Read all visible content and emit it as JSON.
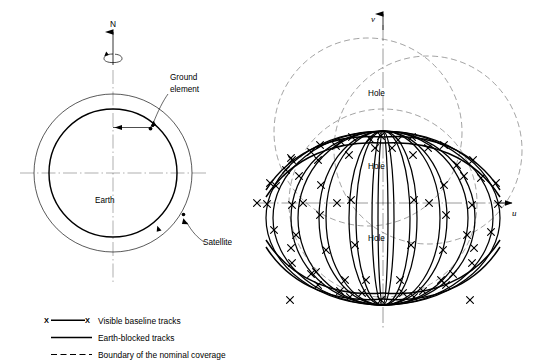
{
  "figure": {
    "background_color": "#ffffff",
    "ink_color": "#000000"
  },
  "left_diagram": {
    "name": "earth-orbit-geometry",
    "labels": {
      "north_axis": "N",
      "ground_element": "Ground\nelement",
      "ground_element_line1": "Ground",
      "ground_element_line2": "element",
      "earth": "Earth",
      "satellite": "Satellite"
    },
    "geometry": {
      "center_x": 113,
      "center_y": 173,
      "earth_radius": 64,
      "orbit_radius": 79,
      "axis_top_y": 30,
      "axis_bottom_y": 283,
      "axis_left_x": 20,
      "axis_right_x": 206,
      "spin_ellipse_cy": 58,
      "spin_ellipse_rx": 9,
      "spin_ellipse_ry": 4,
      "ground_element_x": 151,
      "ground_element_y": 127
    }
  },
  "right_diagram": {
    "name": "uv-plane-baseline-tracks",
    "labels": {
      "v_axis": "v",
      "u_axis": "u",
      "hole_top": "Hole",
      "hole_middle": "Hole",
      "hole_bottom": "Hole"
    },
    "geometry": {
      "origin_x": 383,
      "origin_y": 203,
      "v_axis_top_y": 14,
      "v_axis_bottom_y": 330,
      "u_axis_left_x": 258,
      "u_axis_right_x": 515,
      "convergence_top_y": 137,
      "convergence_bottom_y": 299,
      "track_left_x": 267,
      "track_right_x": 500,
      "hole_top_y": 93,
      "hole_middle_y": 166,
      "hole_bottom_y": 238
    },
    "boundary_circles": [
      {
        "cx": 383,
        "cy": 132,
        "r": 94
      },
      {
        "cx": 383,
        "cy": 203,
        "r": 94
      },
      {
        "cx": 443,
        "cy": 170,
        "r": 94
      }
    ],
    "track_count": 6,
    "marker_symbol": "X"
  },
  "legend": {
    "name": "figure-legend",
    "items": [
      {
        "symbol": "x-line-x",
        "label": "Visible baseline tracks"
      },
      {
        "symbol": "solid-line",
        "label": "Earth-blocked tracks"
      },
      {
        "symbol": "dashed-line",
        "label": "Boundary of the nominal coverage"
      }
    ],
    "marker_char": "X"
  }
}
